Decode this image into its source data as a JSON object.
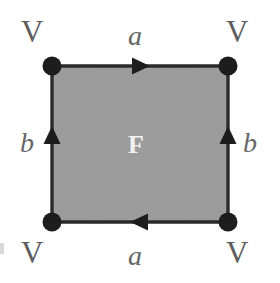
{
  "figure": {
    "name": "torus-identification-square",
    "caption_title": "Fundamental polygon with edge identifications",
    "background_color": "#ffffff"
  },
  "canvas": {
    "width": 280,
    "height": 283
  },
  "polygon": {
    "shape": "square",
    "fill_color": "#9b9b9b",
    "stroke_color": "#2b2b2b",
    "stroke_width": 3,
    "left": 52,
    "top": 66,
    "right": 228,
    "bottom": 222
  },
  "face": {
    "label": "F",
    "color": "#f2f2f2",
    "x": 140,
    "y": 144
  },
  "vertices": [
    {
      "id": "top-left",
      "label": "V",
      "x": 52,
      "y": 66,
      "radius": 9,
      "color": "#1d1d1d"
    },
    {
      "id": "top-right",
      "label": "V",
      "x": 228,
      "y": 66,
      "radius": 9,
      "color": "#1d1d1d"
    },
    {
      "id": "bottom-left",
      "label": "V",
      "x": 52,
      "y": 222,
      "radius": 9,
      "color": "#1d1d1d"
    },
    {
      "id": "bottom-right",
      "label": "V",
      "x": 228,
      "y": 222,
      "radius": 9,
      "color": "#1d1d1d"
    }
  ],
  "vertex_labels": {
    "top_left": "V",
    "top_right": "V",
    "bottom_left": "V",
    "bottom_right": "V",
    "color": "#5d5d5d"
  },
  "edges": [
    {
      "id": "top-edge",
      "label": "a",
      "from": "top-left",
      "to": "top-right",
      "direction": "right",
      "arrow_count": 1,
      "label_position": "above",
      "color": "#2b2b2b"
    },
    {
      "id": "bottom-edge",
      "label": "a",
      "from": "bottom-right",
      "to": "bottom-left",
      "direction": "left",
      "arrow_count": 1,
      "label_position": "below",
      "color": "#2b2b2b"
    },
    {
      "id": "left-edge",
      "label": "b",
      "from": "bottom-left",
      "to": "top-left",
      "direction": "up",
      "arrow_count": 1,
      "label_position": "left",
      "color": "#2b2b2b"
    },
    {
      "id": "right-edge",
      "label": "b",
      "from": "bottom-right",
      "to": "top-right",
      "direction": "up",
      "arrow_count": 1,
      "label_position": "right",
      "color": "#2b2b2b"
    }
  ],
  "edge_labels": {
    "top": "a",
    "bottom": "a",
    "left": "b",
    "right": "b",
    "color": "#666666"
  },
  "colors": {
    "face_fill": "#9b9b9b",
    "edge_stroke": "#2b2b2b",
    "vertex_dot": "#1d1d1d",
    "label_gray": "#5d5d5d",
    "face_label": "#f2f2f2",
    "background": "#ffffff"
  }
}
